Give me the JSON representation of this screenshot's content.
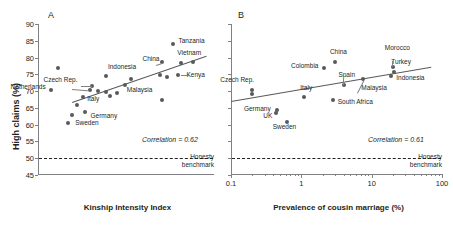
{
  "figure": {
    "panel_a_letter": "A",
    "panel_b_letter": "B"
  },
  "chart_data": [
    {
      "type": "scatter",
      "panel": "A",
      "title": "A",
      "xlabel": "Kinship Intensity Index",
      "ylabel": "High claims (%)",
      "xscale": "linear",
      "yscale": "linear",
      "ylim": [
        45,
        90
      ],
      "yticks": [
        45,
        50,
        55,
        60,
        65,
        70,
        75,
        80,
        85,
        90
      ],
      "ytick_labels": [
        "45",
        "50",
        "55",
        "60",
        "65",
        "70",
        "75",
        "80",
        "85",
        "90"
      ],
      "xticks_labelled": false,
      "grid": false,
      "legend": "none",
      "annotations": {
        "correlation": "Correlation = 0.62",
        "benchmark_label_line1": "Honesty",
        "benchmark_label_line2": "benchmark",
        "benchmark_value": 50
      },
      "points": [
        {
          "label": "",
          "x": 0.21,
          "y": 76.8
        },
        {
          "label": "Netherlands",
          "x": 0.18,
          "y": 70.3
        },
        {
          "label": "Czech Rep.",
          "x": 0.335,
          "y": 70.2
        },
        {
          "label": "",
          "x": 0.345,
          "y": 71.6
        },
        {
          "label": "",
          "x": 0.37,
          "y": 70.0
        },
        {
          "label": "",
          "x": 0.4,
          "y": 69.8
        },
        {
          "label": "",
          "x": 0.415,
          "y": 68.6
        },
        {
          "label": "",
          "x": 0.445,
          "y": 69.3
        },
        {
          "label": "Italy",
          "x": 0.31,
          "y": 68.1
        },
        {
          "label": "Germany",
          "x": 0.315,
          "y": 63.8
        },
        {
          "label": "",
          "x": 0.285,
          "y": 65.8
        },
        {
          "label": "",
          "x": 0.265,
          "y": 62.8
        },
        {
          "label": "Sweden",
          "x": 0.25,
          "y": 60.6
        },
        {
          "label": "Indonesia",
          "x": 0.4,
          "y": 74.5
        },
        {
          "label": "",
          "x": 0.5,
          "y": 73.6
        },
        {
          "label": "Malaysia",
          "x": 0.475,
          "y": 71.9
        },
        {
          "label": "China",
          "x": 0.625,
          "y": 78.7
        },
        {
          "label": "Vietnam",
          "x": 0.7,
          "y": 78.4
        },
        {
          "label": "",
          "x": 0.745,
          "y": 78.8
        },
        {
          "label": "Tanzania",
          "x": 0.665,
          "y": 84.0
        },
        {
          "label": "Kenya",
          "x": 0.685,
          "y": 74.8
        },
        {
          "label": "",
          "x": 0.645,
          "y": 74.2
        },
        {
          "label": "",
          "x": 0.615,
          "y": 74.9
        },
        {
          "label": "",
          "x": 0.625,
          "y": 67.3
        }
      ],
      "trendline": {
        "x0": 0.265,
        "y0": 66.8,
        "x1": 0.8,
        "y1": 80.6
      }
    },
    {
      "type": "scatter",
      "panel": "B",
      "title": "B",
      "xlabel": "Prevalence of cousin marriage (%)",
      "ylabel": "",
      "xscale": "log",
      "yscale": "linear",
      "xlim": [
        0.1,
        100
      ],
      "ylim": [
        45,
        90
      ],
      "xticks": [
        0.1,
        1,
        10,
        100
      ],
      "xtick_labels": [
        "0.1",
        "1",
        "10",
        "100"
      ],
      "yticks": [
        45,
        50,
        55,
        60,
        65,
        70,
        75,
        80,
        85,
        90
      ],
      "ytick_labels_shown": false,
      "grid": false,
      "legend": "none",
      "annotations": {
        "correlation": "Correlation = 0.61",
        "benchmark_label_line1": "Honesty",
        "benchmark_label_line2": "benchmark",
        "benchmark_value": 50
      },
      "points": [
        {
          "label": "Czech Rep.",
          "x": 0.2,
          "y": 70.3
        },
        {
          "label": "",
          "x": 0.2,
          "y": 69.0
        },
        {
          "label": "Germany",
          "x": 0.45,
          "y": 64.3
        },
        {
          "label": "UK",
          "x": 0.44,
          "y": 63.4
        },
        {
          "label": "Sweden",
          "x": 0.62,
          "y": 60.8
        },
        {
          "label": "Italy",
          "x": 1.1,
          "y": 68.2
        },
        {
          "label": "South Africa",
          "x": 2.8,
          "y": 67.3
        },
        {
          "label": "Colombia",
          "x": 2.1,
          "y": 77.0
        },
        {
          "label": "China",
          "x": 3.0,
          "y": 78.8
        },
        {
          "label": "Spain",
          "x": 4.1,
          "y": 71.9
        },
        {
          "label": "Malaysia",
          "x": 7.6,
          "y": 73.6
        },
        {
          "label": "Indonesia",
          "x": 19.0,
          "y": 74.5
        },
        {
          "label": "Turkey",
          "x": 21.0,
          "y": 75.6
        },
        {
          "label": "Morocco",
          "x": 20.0,
          "y": 77.1
        }
      ],
      "trendline": {
        "x0": 0.1,
        "y0": 67.2,
        "x1": 70.0,
        "y1": 77.4
      }
    }
  ]
}
